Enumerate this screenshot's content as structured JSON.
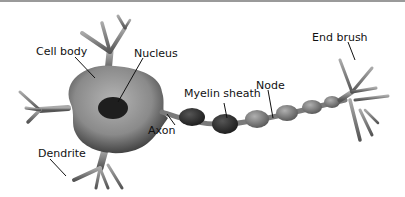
{
  "diagram": {
    "labels": {
      "cell_body": "Cell body",
      "nucleus": "Nucleus",
      "myelin_sheath": "Myelin sheath",
      "node": "Node",
      "end_brush": "End brush",
      "axon": "Axon",
      "dendrite": "Dendrite"
    },
    "colors": {
      "body": "#8e8e8e",
      "body_dark": "#3a3a3a",
      "nucleus": "#1e1e1e",
      "myelin_dark": "#2e2e2e",
      "myelin_light": "#858585",
      "leader_line": "#111111"
    }
  }
}
